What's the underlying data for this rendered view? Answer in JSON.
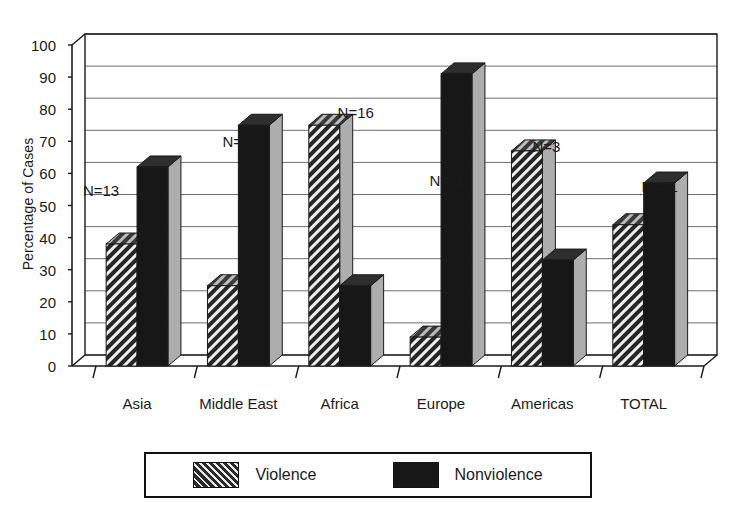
{
  "chart_data": {
    "type": "bar",
    "title": "",
    "subtitle": "",
    "xlabel": "",
    "ylabel": "Percentage of Cases",
    "categories": [
      "Asia",
      "Middle East",
      "Africa",
      "Europe",
      "Americas",
      "TOTAL"
    ],
    "series": [
      {
        "name": "Violence",
        "values": [
          38,
          25,
          75,
          9,
          67,
          44
        ],
        "fill": "diagonal-hatch",
        "color": "#3b3b3b"
      },
      {
        "name": "Nonviolence",
        "values": [
          62,
          75,
          25,
          91,
          33,
          57
        ],
        "fill": "solid",
        "color": "#171717"
      }
    ],
    "annotations": [
      {
        "text": "N=13",
        "category": "Asia"
      },
      {
        "text": "N=8",
        "category": "Middle East"
      },
      {
        "text": "N=16",
        "category": "Africa"
      },
      {
        "text": "N=11",
        "category": "Europe"
      },
      {
        "text": "N=3",
        "category": "Americas"
      },
      {
        "text": "N=51",
        "category": "TOTAL"
      }
    ],
    "ylim": [
      0,
      100
    ],
    "ytick_values": [
      0,
      10,
      20,
      30,
      40,
      50,
      60,
      70,
      80,
      90,
      100
    ],
    "ytick_labels": [
      "0",
      "10",
      "20",
      "30",
      "40",
      "50",
      "60",
      "70",
      "80",
      "90",
      "100"
    ],
    "grid": "horizontal",
    "legend_position": "bottom-center",
    "style": "3d-bars-grayscale"
  },
  "axes": {
    "y_title": "Percentage of Cases"
  },
  "legend": {
    "entries": [
      {
        "label": "Violence",
        "swatch": "hatched-swatch"
      },
      {
        "label": "Nonviolence",
        "swatch": "solid-black-swatch"
      }
    ]
  },
  "colors": {
    "bar_front_violence": "#3b3b3b",
    "bar_front_nonviolence": "#171717",
    "bar_top": "#2e2e2e",
    "bar_side": "#adadad",
    "grid": "#6f6f6f",
    "frame": "#1a1a1a",
    "background": "#ffffff",
    "text": "#1a1a1a"
  }
}
